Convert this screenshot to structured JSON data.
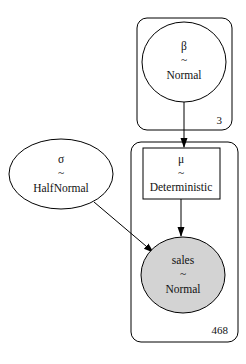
{
  "diagram": {
    "type": "probabilistic-graphical-model",
    "plates": [
      {
        "id": "plate-3",
        "label": "3"
      },
      {
        "id": "plate-468",
        "label": "468"
      }
    ],
    "nodes": {
      "beta": {
        "name": "β",
        "tilde": "~",
        "dist": "Normal",
        "shape": "ellipse",
        "fill": "#ffffff"
      },
      "sigma": {
        "name": "σ",
        "tilde": "~",
        "dist": "HalfNormal",
        "shape": "ellipse",
        "fill": "#ffffff"
      },
      "mu": {
        "name": "μ",
        "tilde": "~",
        "dist": "Deterministic",
        "shape": "box",
        "fill": "#ffffff"
      },
      "sales": {
        "name": "sales",
        "tilde": "~",
        "dist": "Normal",
        "shape": "ellipse",
        "fill": "#d3d3d3",
        "observed": true
      }
    },
    "edges": [
      {
        "from": "β",
        "to": "μ"
      },
      {
        "from": "μ",
        "to": "sales"
      },
      {
        "from": "σ",
        "to": "sales"
      }
    ]
  }
}
